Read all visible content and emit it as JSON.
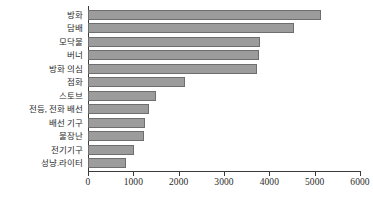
{
  "chart_data": {
    "type": "bar",
    "orientation": "horizontal",
    "title": "",
    "subtitle": "",
    "xlabel": "",
    "ylabel": "",
    "xlim": [
      0,
      6000
    ],
    "xticks": [
      0,
      1000,
      2000,
      3000,
      4000,
      5000,
      6000
    ],
    "xtick_labels": [
      "0",
      "1000",
      "2000",
      "3000",
      "4000",
      "5000",
      "6000"
    ],
    "grid": false,
    "legend": null,
    "bar_color": "#9c9c9c",
    "bar_edge_color": "#6e6e6e",
    "axis_color": "#3a3a3a",
    "categories": [
      "방화",
      "담배",
      "모닥불",
      "버너",
      "방화 의심",
      "점화",
      "스토브",
      "전등, 전화 배선",
      "배선 기구",
      "불장난",
      "전기기구",
      "성냥.라이터"
    ],
    "values": [
      5150,
      4550,
      3800,
      3780,
      3730,
      2130,
      1490,
      1350,
      1260,
      1240,
      1020,
      830
    ]
  }
}
